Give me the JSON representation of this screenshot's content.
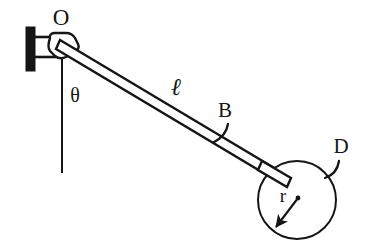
{
  "figure": {
    "background_color": "#ffffff",
    "stroke_color": "#151515",
    "width": 368,
    "height": 247
  },
  "labels": {
    "pivot": "O",
    "angle": "θ",
    "rod_length": "ℓ",
    "rod_point": "B",
    "disk": "D",
    "radius": "r"
  },
  "geometry": {
    "wall_bracket": {
      "bar_x": 26,
      "bar_y_top": 27,
      "bar_y_bottom": 71,
      "bar_width": 9
    },
    "pivot_point": {
      "x": 62,
      "y": 45
    },
    "rod": {
      "start_x": 62,
      "start_y": 45,
      "end_x": 288,
      "end_y": 183,
      "thickness": 7
    },
    "vertical_reference": {
      "x": 62,
      "y_top": 58,
      "y_bottom": 173
    },
    "disk": {
      "center_x": 297,
      "center_y": 200,
      "radius": 39
    },
    "radius_arrow": {
      "from_x": 298,
      "from_y": 198,
      "to_x": 274,
      "to_y": 229
    }
  },
  "label_positions": {
    "pivot": {
      "x": 61,
      "y": 24
    },
    "angle": {
      "x": 75,
      "y": 101
    },
    "rod_length": {
      "x": 176,
      "y": 93
    },
    "rod_point": {
      "x": 224,
      "y": 116
    },
    "disk": {
      "x": 340,
      "y": 152
    },
    "radius": {
      "x": 284,
      "y": 201
    }
  }
}
